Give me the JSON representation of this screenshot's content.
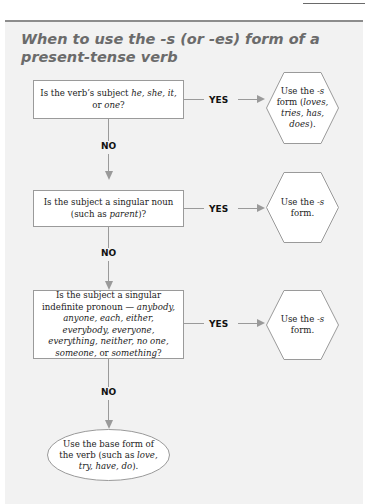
{
  "title": "When to use the -s (or -es) form of a present-tense verb",
  "colors": {
    "panel_background": "#f2f2f2",
    "title_color": "#6b6b6b",
    "line_color": "#9a9a9a",
    "box_fill": "#ffffff"
  },
  "flowchart": {
    "questions": [
      {
        "text_parts": [
          "Is the verb’s subject ",
          "he,",
          " ",
          "she, it,",
          " or ",
          "one",
          "?"
        ],
        "italic_mask": [
          false,
          true,
          false,
          true,
          false,
          true,
          false
        ]
      },
      {
        "text_parts": [
          "Is the subject a singular noun (such as ",
          "parent",
          ")?"
        ],
        "italic_mask": [
          false,
          true,
          false
        ]
      },
      {
        "text_parts": [
          "Is the subject a singular indefinite pronoun — ",
          "anybody, anyone, each, either, everybody, everyone, everything, neither, no one, someone,",
          " or ",
          "something",
          "?"
        ],
        "italic_mask": [
          false,
          true,
          false,
          true,
          false
        ]
      }
    ],
    "outcomes": [
      {
        "text_parts": [
          "Use the ",
          "-s",
          " form (",
          "loves, tries, has, does",
          ")."
        ],
        "italic_mask": [
          false,
          true,
          false,
          true,
          false
        ]
      },
      {
        "text_parts": [
          "Use the ",
          "-s",
          " form."
        ],
        "italic_mask": [
          false,
          true,
          false
        ]
      },
      {
        "text_parts": [
          "Use the ",
          "-s",
          " form."
        ],
        "italic_mask": [
          false,
          true,
          false
        ]
      }
    ],
    "final": {
      "text_parts": [
        "Use the base form of the verb (such as ",
        "love, try, have, do",
        ")."
      ],
      "italic_mask": [
        false,
        true,
        false
      ]
    },
    "yes_label": "YES",
    "no_label": "NO"
  }
}
